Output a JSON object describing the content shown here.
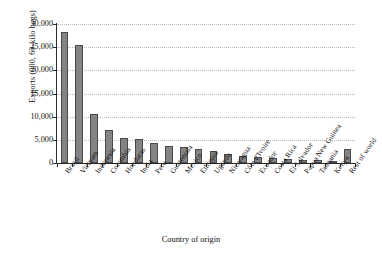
{
  "chart_data": {
    "type": "bar",
    "title": "",
    "xlabel": "Country of origin",
    "ylabel": "Exports (000, 60-kilo bags)",
    "ylim": [
      0,
      30000
    ],
    "yticks": [
      0,
      5000,
      10000,
      15000,
      20000,
      25000,
      30000
    ],
    "ytick_labels": [
      "0",
      "5,000",
      "10,000",
      "15,000",
      "20,000",
      "25,000",
      "30,000"
    ],
    "grid": "horizontal-dotted",
    "legend": "none",
    "bar_color": "#848484",
    "bar_edge_color": "#4a4a4a",
    "categories": [
      "Brazil",
      "Vietnam",
      "Indonesia",
      "Colombia",
      "Honduras",
      "India",
      "Peru",
      "Guatemala",
      "Mexico",
      "Ethiopia",
      "Uganda",
      "Nicaragua",
      "Côte d'Ivoire",
      "Ecuador",
      "Costa Rica",
      "El Salvador",
      "Papua New Guinea",
      "Tanzania",
      "Kenya",
      "Rest of world"
    ],
    "values": [
      28300,
      25500,
      10600,
      7100,
      5450,
      5250,
      4300,
      3650,
      3400,
      3100,
      2550,
      1850,
      1550,
      1400,
      1150,
      900,
      750,
      550,
      450,
      3000
    ]
  }
}
